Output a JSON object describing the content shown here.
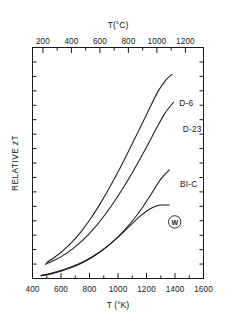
{
  "figure": {
    "background_color": "#ffffff",
    "line_color": "#1a1a1a"
  },
  "chart_data": {
    "type": "line",
    "title": "",
    "subtitle": "",
    "xlabel": "T (°K)",
    "xlabel_top": "T(°C)",
    "ylabel": "RELATIVE zT",
    "xlim": [
      400,
      1600
    ],
    "xlim_top": [
      127,
      1327
    ],
    "ylim": [
      0,
      1
    ],
    "grid": false,
    "legend_position": "inline-right-of-curve-ends",
    "x_ticks": [
      400,
      600,
      800,
      1000,
      1200,
      1400,
      1600
    ],
    "x_tick_labels": [
      "400",
      "600",
      "800",
      "1000",
      "1200",
      "1400",
      "1600"
    ],
    "x_minor_ticks": [
      500,
      700,
      900,
      1100,
      1300,
      1500
    ],
    "x_ticks_top": [
      200,
      400,
      600,
      800,
      1000,
      1200
    ],
    "x_tick_labels_top": [
      "200",
      "400",
      "600",
      "800",
      "1000",
      "1200"
    ],
    "x_minor_ticks_top": [
      300,
      500,
      700,
      900,
      1100
    ],
    "y_ticks_unlabeled_count": 15,
    "y_tick_labels": [],
    "series": [
      {
        "name": "D-6",
        "label": "D-6",
        "label_x": 1430,
        "label_y": 0.748,
        "marker": "none",
        "points": [
          [
            500,
            0.07
          ],
          [
            560,
            0.094
          ],
          [
            620,
            0.124
          ],
          [
            680,
            0.16
          ],
          [
            740,
            0.202
          ],
          [
            800,
            0.252
          ],
          [
            860,
            0.309
          ],
          [
            920,
            0.371
          ],
          [
            980,
            0.438
          ],
          [
            1040,
            0.509
          ],
          [
            1100,
            0.583
          ],
          [
            1160,
            0.659
          ],
          [
            1220,
            0.735
          ],
          [
            1280,
            0.809
          ],
          [
            1340,
            0.862
          ],
          [
            1380,
            0.884
          ]
        ]
      },
      {
        "name": "D-23",
        "label": "D-23",
        "label_x": 1455,
        "label_y": 0.636,
        "marker": "none",
        "points": [
          [
            490,
            0.062
          ],
          [
            550,
            0.078
          ],
          [
            610,
            0.098
          ],
          [
            670,
            0.123
          ],
          [
            730,
            0.153
          ],
          [
            790,
            0.189
          ],
          [
            850,
            0.23
          ],
          [
            910,
            0.277
          ],
          [
            970,
            0.329
          ],
          [
            1030,
            0.386
          ],
          [
            1090,
            0.447
          ],
          [
            1150,
            0.512
          ],
          [
            1210,
            0.58
          ],
          [
            1270,
            0.65
          ],
          [
            1330,
            0.716
          ],
          [
            1390,
            0.763
          ]
        ]
      },
      {
        "name": "BI-C",
        "label": "BI-C",
        "label_x": 1435,
        "label_y": 0.395,
        "marker": "none",
        "points": [
          [
            460,
            0.013
          ],
          [
            520,
            0.021
          ],
          [
            580,
            0.031
          ],
          [
            640,
            0.043
          ],
          [
            700,
            0.057
          ],
          [
            760,
            0.074
          ],
          [
            820,
            0.094
          ],
          [
            880,
            0.118
          ],
          [
            940,
            0.147
          ],
          [
            1000,
            0.18
          ],
          [
            1060,
            0.219
          ],
          [
            1120,
            0.264
          ],
          [
            1180,
            0.315
          ],
          [
            1240,
            0.372
          ],
          [
            1300,
            0.43
          ],
          [
            1360,
            0.47
          ]
        ]
      },
      {
        "name": "W",
        "label": "W",
        "label_style": "circled",
        "label_x": 1398,
        "label_y": 0.245,
        "marker": "circled-letter",
        "points": [
          [
            460,
            0.012
          ],
          [
            530,
            0.02
          ],
          [
            600,
            0.031
          ],
          [
            670,
            0.046
          ],
          [
            740,
            0.065
          ],
          [
            810,
            0.089
          ],
          [
            880,
            0.118
          ],
          [
            950,
            0.152
          ],
          [
            1020,
            0.19
          ],
          [
            1090,
            0.232
          ],
          [
            1160,
            0.272
          ],
          [
            1220,
            0.3
          ],
          [
            1270,
            0.314
          ],
          [
            1310,
            0.318
          ],
          [
            1360,
            0.318
          ]
        ]
      }
    ]
  }
}
